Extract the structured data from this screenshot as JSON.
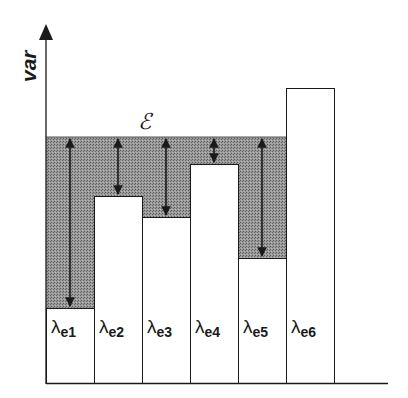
{
  "diagram": {
    "y_axis_label": "var",
    "region_label": "ℰ",
    "colors": {
      "ink": "#1a1a1a",
      "shade": "#8a8a8a",
      "bar_fill": "#ffffff",
      "background": "#ffffff"
    },
    "axis": {
      "x": 46,
      "top": 26,
      "baseline": 383,
      "x_end": 388
    },
    "shade_top": 137,
    "bars": [
      {
        "label": "λ",
        "sub": "e1",
        "x0": 46,
        "x1": 94,
        "top": 308
      },
      {
        "label": "λ",
        "sub": "e2",
        "x0": 94,
        "x1": 142,
        "top": 196
      },
      {
        "label": "λ",
        "sub": "e3",
        "x0": 142,
        "x1": 190,
        "top": 217
      },
      {
        "label": "λ",
        "sub": "e4",
        "x0": 190,
        "x1": 238,
        "top": 164
      },
      {
        "label": "λ",
        "sub": "e5",
        "x0": 238,
        "x1": 286,
        "top": 258
      },
      {
        "label": "λ",
        "sub": "e6",
        "x0": 286,
        "x1": 334,
        "top": 88
      }
    ]
  },
  "chart_data": {
    "type": "bar",
    "title": "",
    "xlabel": "",
    "ylabel": "var",
    "categories": [
      "λe1",
      "λe2",
      "λe3",
      "λe4",
      "λe5",
      "λe6"
    ],
    "values": [
      75,
      187,
      166,
      219,
      125,
      295
    ],
    "threshold_label": "ℰ",
    "threshold_value": 246
  }
}
